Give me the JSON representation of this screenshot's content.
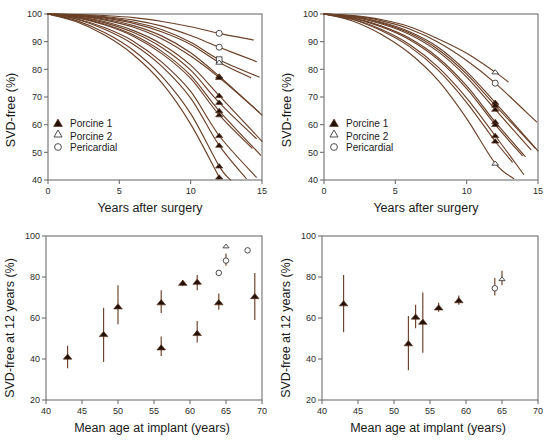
{
  "figure": {
    "panels": [
      "top-left",
      "top-right",
      "bottom-left",
      "bottom-right"
    ],
    "curve_color": "#6b4028",
    "marker_fill_color": "#231008",
    "marker_open_color": "#ffffff",
    "axis_color": "#6f6f6f"
  },
  "legend": {
    "items": [
      {
        "key": "porcine1",
        "label": "Porcine 1",
        "marker": "filled-triangle-icon"
      },
      {
        "key": "porcine2",
        "label": "Porcine 2",
        "marker": "open-triangle-icon"
      },
      {
        "key": "pericardial",
        "label": "Pericardial",
        "marker": "open-circle-icon"
      }
    ]
  },
  "chart_data": [
    {
      "id": "top-left",
      "type": "line",
      "title": "",
      "xlabel": "Years after surgery",
      "ylabel": "SVD-free (%)",
      "xlim": [
        0,
        15
      ],
      "ylim": [
        40,
        100
      ],
      "xticks": [
        0,
        5,
        10,
        15
      ],
      "yticks": [
        40,
        50,
        60,
        70,
        80,
        90,
        100
      ],
      "grid": false,
      "legend_position": "inside-left",
      "series": [
        {
          "name": "curve-1",
          "endpoint_marker": "open-circle",
          "endpoint_x": 12,
          "endpoint_y": 93,
          "x": [
            0,
            2,
            4,
            6,
            8,
            10,
            12,
            14.4
          ],
          "values": [
            100,
            99.8,
            99.4,
            98.7,
            97.3,
            95.4,
            93.0,
            90.6
          ]
        },
        {
          "name": "curve-2",
          "endpoint_marker": "open-circle",
          "endpoint_x": 12,
          "endpoint_y": 88,
          "x": [
            0,
            2,
            4,
            6,
            8,
            10,
            12,
            14.6
          ],
          "values": [
            100,
            99.7,
            99.0,
            97.8,
            95.6,
            92.2,
            88.0,
            82.8
          ]
        },
        {
          "name": "curve-3",
          "endpoint_marker": "open-square",
          "endpoint_x": 12,
          "endpoint_y": 83.5,
          "x": [
            0,
            2,
            4,
            6,
            8,
            10,
            12,
            14.8
          ],
          "values": [
            100,
            99.6,
            98.8,
            97.1,
            94.3,
            89.8,
            83.5,
            77.2
          ]
        },
        {
          "name": "curve-4",
          "endpoint_marker": "open-triangle",
          "endpoint_x": 12,
          "endpoint_y": 82.5,
          "x": [
            0,
            2,
            4,
            6,
            8,
            10,
            12,
            14.2
          ],
          "values": [
            100,
            99.5,
            98.5,
            96.6,
            93.5,
            89.0,
            82.5,
            77.0
          ]
        },
        {
          "name": "curve-5",
          "endpoint_marker": "filled-triangle",
          "endpoint_x": 12,
          "endpoint_y": 77.5,
          "x": [
            0,
            2,
            4,
            6,
            8,
            10,
            12,
            15.0
          ],
          "values": [
            100,
            99.4,
            98.1,
            95.8,
            92.0,
            86.0,
            77.5,
            63.5
          ]
        },
        {
          "name": "curve-6",
          "endpoint_marker": "filled-triangle",
          "endpoint_x": 12,
          "endpoint_y": 77.0,
          "x": [
            0,
            2,
            4,
            6,
            8,
            10,
            12,
            14.8
          ],
          "values": [
            100,
            99.3,
            97.8,
            95.2,
            91.0,
            84.8,
            77.0,
            64.5
          ]
        },
        {
          "name": "curve-7",
          "endpoint_marker": "filled-triangle",
          "endpoint_x": 12,
          "endpoint_y": 70.5,
          "x": [
            0,
            2,
            4,
            6,
            8,
            10,
            12,
            15.0
          ],
          "values": [
            100,
            99.1,
            97.2,
            94.0,
            89.0,
            81.5,
            70.5,
            54.0
          ]
        },
        {
          "name": "curve-8",
          "endpoint_marker": "filled-triangle",
          "endpoint_x": 12,
          "endpoint_y": 68.0,
          "x": [
            0,
            2,
            4,
            6,
            8,
            10,
            12,
            14.6
          ],
          "values": [
            100,
            99.0,
            96.8,
            93.3,
            87.8,
            79.7,
            68.0,
            55.0
          ]
        },
        {
          "name": "curve-9",
          "endpoint_marker": "filled-triangle",
          "endpoint_x": 12,
          "endpoint_y": 65.0,
          "x": [
            0,
            2,
            4,
            6,
            8,
            10,
            12,
            14.9
          ],
          "values": [
            100,
            98.8,
            96.3,
            92.4,
            86.4,
            77.8,
            65.0,
            49.0
          ]
        },
        {
          "name": "curve-10",
          "endpoint_marker": "filled-triangle",
          "endpoint_x": 12,
          "endpoint_y": 63.5,
          "x": [
            0,
            2,
            4,
            6,
            8,
            10,
            12,
            14.3
          ],
          "values": [
            100,
            98.7,
            96.0,
            91.9,
            85.6,
            76.7,
            63.5,
            51.5
          ]
        },
        {
          "name": "curve-11",
          "endpoint_marker": "filled-triangle",
          "endpoint_x": 12,
          "endpoint_y": 56.0,
          "x": [
            0,
            2,
            4,
            6,
            8,
            10,
            12,
            14.6
          ],
          "values": [
            100,
            98.3,
            95.0,
            90.1,
            82.5,
            72.0,
            56.0,
            41.0
          ]
        },
        {
          "name": "curve-12",
          "endpoint_marker": "filled-triangle",
          "endpoint_x": 12,
          "endpoint_y": 52.5,
          "x": [
            0,
            2,
            4,
            6,
            8,
            10,
            12,
            13.9
          ],
          "values": [
            100,
            98.1,
            94.4,
            89.0,
            81.0,
            69.6,
            52.5,
            40.5
          ]
        },
        {
          "name": "curve-13",
          "endpoint_marker": "filled-triangle",
          "endpoint_x": 12,
          "endpoint_y": 45.0,
          "x": [
            0,
            2,
            4,
            6,
            8,
            10,
            12,
            12.8
          ],
          "values": [
            100,
            97.6,
            93.2,
            86.8,
            77.4,
            64.0,
            45.0,
            40.0
          ]
        },
        {
          "name": "curve-14",
          "endpoint_marker": "filled-triangle",
          "endpoint_x": 12,
          "endpoint_y": 41.0,
          "x": [
            0,
            2,
            4,
            6,
            8,
            10,
            12
          ],
          "values": [
            100,
            97.2,
            92.3,
            85.2,
            75.0,
            60.2,
            41.0
          ]
        }
      ]
    },
    {
      "id": "top-right",
      "type": "line",
      "title": "",
      "xlabel": "Years after surgery",
      "ylabel": "SVD-free (%)",
      "xlim": [
        0,
        15
      ],
      "ylim": [
        40,
        100
      ],
      "xticks": [
        0,
        5,
        10,
        15
      ],
      "yticks": [
        40,
        50,
        60,
        70,
        80,
        90,
        100
      ],
      "grid": false,
      "legend_position": "inside-left",
      "series": [
        {
          "name": "curve-1",
          "endpoint_marker": "open-triangle",
          "endpoint_x": 12,
          "endpoint_y": 79.0,
          "x": [
            0,
            2,
            4,
            6,
            8,
            10,
            12,
            12.9
          ],
          "values": [
            100,
            99.4,
            98.0,
            95.4,
            91.0,
            85.8,
            79.0,
            75.5
          ]
        },
        {
          "name": "curve-2",
          "endpoint_marker": "open-circle",
          "endpoint_x": 12,
          "endpoint_y": 75.0,
          "x": [
            0,
            2,
            4,
            6,
            8,
            10,
            12,
            14.9
          ],
          "values": [
            100,
            99.3,
            97.6,
            94.6,
            89.8,
            83.2,
            75.0,
            61.0
          ]
        },
        {
          "name": "curve-3",
          "endpoint_marker": "filled-triangle",
          "endpoint_x": 12,
          "endpoint_y": 68.0,
          "x": [
            0,
            2,
            4,
            6,
            8,
            10,
            12,
            15.0
          ],
          "values": [
            100,
            99.1,
            97.1,
            93.6,
            88.0,
            79.2,
            68.0,
            50.5
          ]
        },
        {
          "name": "curve-4",
          "endpoint_marker": "filled-triangle",
          "endpoint_x": 12,
          "endpoint_y": 67.0,
          "x": [
            0,
            2,
            4,
            6,
            8,
            10,
            12,
            14.8
          ],
          "values": [
            100,
            99.0,
            96.8,
            93.1,
            87.2,
            78.3,
            67.0,
            51.5
          ]
        },
        {
          "name": "curve-5",
          "endpoint_marker": "filled-triangle",
          "endpoint_x": 12,
          "endpoint_y": 65.5,
          "x": [
            0,
            2,
            4,
            6,
            8,
            10,
            12,
            14.5
          ],
          "values": [
            100,
            98.9,
            96.5,
            92.6,
            86.4,
            77.2,
            65.5,
            51.0
          ]
        },
        {
          "name": "curve-6",
          "endpoint_marker": "filled-triangle",
          "endpoint_x": 12,
          "endpoint_y": 61.0,
          "x": [
            0,
            2,
            4,
            6,
            8,
            10,
            12,
            14.1
          ],
          "values": [
            100,
            98.6,
            95.7,
            91.2,
            84.2,
            74.0,
            61.0,
            48.5
          ]
        },
        {
          "name": "curve-7",
          "endpoint_marker": "filled-triangle",
          "endpoint_x": 12,
          "endpoint_y": 60.0,
          "x": [
            0,
            2,
            4,
            6,
            8,
            10,
            12,
            13.9
          ],
          "values": [
            100,
            98.5,
            95.4,
            90.7,
            83.5,
            73.0,
            60.0,
            48.8
          ]
        },
        {
          "name": "curve-8",
          "endpoint_marker": "filled-triangle",
          "endpoint_x": 12,
          "endpoint_y": 56.0,
          "x": [
            0,
            2,
            4,
            6,
            8,
            10,
            12,
            14.0
          ],
          "values": [
            100,
            98.2,
            94.5,
            89.0,
            80.8,
            69.6,
            56.0,
            42.0
          ]
        },
        {
          "name": "curve-9",
          "endpoint_marker": "filled-triangle",
          "endpoint_x": 12,
          "endpoint_y": 54.0,
          "x": [
            0,
            2,
            4,
            6,
            8,
            10,
            12,
            13.2
          ],
          "values": [
            100,
            98.0,
            94.0,
            88.2,
            79.7,
            68.0,
            54.0,
            46.5
          ]
        },
        {
          "name": "curve-10",
          "endpoint_marker": "open-triangle",
          "endpoint_x": 12,
          "endpoint_y": 46.0,
          "x": [
            0,
            2,
            4,
            6,
            8,
            10,
            12,
            13.3
          ],
          "values": [
            100,
            97.5,
            92.7,
            85.8,
            76.0,
            62.2,
            46.0,
            40.5
          ]
        }
      ]
    },
    {
      "id": "bottom-left",
      "type": "scatter",
      "title": "",
      "xlabel": "Mean age at implant (years)",
      "ylabel": "SVD-free at 12 years (%)",
      "xlim": [
        40,
        70
      ],
      "ylim": [
        20,
        100
      ],
      "xticks": [
        40,
        45,
        50,
        55,
        60,
        65,
        70
      ],
      "yticks": [
        20,
        40,
        60,
        80,
        100
      ],
      "grid": false,
      "points": [
        {
          "x": 43.0,
          "y": 41.0,
          "lo": 35.5,
          "hi": 46.5,
          "marker": "filled-triangle"
        },
        {
          "x": 48.0,
          "y": 52.0,
          "lo": 38.5,
          "hi": 65.0,
          "marker": "filled-triangle"
        },
        {
          "x": 50.0,
          "y": 65.5,
          "lo": 57.0,
          "hi": 76.0,
          "marker": "filled-triangle"
        },
        {
          "x": 56.0,
          "y": 45.5,
          "lo": 41.5,
          "hi": 51.0,
          "marker": "filled-triangle"
        },
        {
          "x": 56.0,
          "y": 67.5,
          "lo": 62.5,
          "hi": 73.5,
          "marker": "filled-triangle"
        },
        {
          "x": 59.0,
          "y": 77.0,
          "lo": 75.5,
          "hi": 78.5,
          "marker": "filled-triangle"
        },
        {
          "x": 61.0,
          "y": 52.5,
          "lo": 48.0,
          "hi": 58.5,
          "marker": "filled-triangle"
        },
        {
          "x": 61.0,
          "y": 77.5,
          "lo": 73.5,
          "hi": 81.0,
          "marker": "filled-triangle"
        },
        {
          "x": 64.0,
          "y": 67.5,
          "lo": 64.0,
          "hi": 72.0,
          "marker": "filled-triangle"
        },
        {
          "x": 69.0,
          "y": 70.5,
          "lo": 59.0,
          "hi": 82.0,
          "marker": "filled-triangle"
        },
        {
          "x": 64.0,
          "y": 82.0,
          "lo": 82.0,
          "hi": 82.0,
          "marker": "open-circle"
        },
        {
          "x": 65.0,
          "y": 88.0,
          "lo": 85.5,
          "hi": 91.5,
          "marker": "open-circle"
        },
        {
          "x": 65.0,
          "y": 95.0,
          "lo": 95.0,
          "hi": 95.0,
          "marker": "open-triangle"
        },
        {
          "x": 68.0,
          "y": 93.0,
          "lo": 93.0,
          "hi": 93.0,
          "marker": "open-circle"
        }
      ]
    },
    {
      "id": "bottom-right",
      "type": "scatter",
      "title": "",
      "xlabel": "Mean age at implant (years)",
      "ylabel": "SVD-free at 12 years (%)",
      "xlim": [
        40,
        70
      ],
      "ylim": [
        20,
        100
      ],
      "xticks": [
        40,
        45,
        50,
        55,
        60,
        65,
        70
      ],
      "yticks": [
        20,
        40,
        60,
        80,
        100
      ],
      "grid": false,
      "points": [
        {
          "x": 43.0,
          "y": 67.0,
          "lo": 53.0,
          "hi": 81.0,
          "marker": "filled-triangle"
        },
        {
          "x": 52.0,
          "y": 47.5,
          "lo": 34.5,
          "hi": 61.0,
          "marker": "filled-triangle"
        },
        {
          "x": 53.0,
          "y": 60.5,
          "lo": 55.0,
          "hi": 66.5,
          "marker": "filled-triangle"
        },
        {
          "x": 54.0,
          "y": 58.0,
          "lo": 43.0,
          "hi": 72.5,
          "marker": "filled-triangle"
        },
        {
          "x": 56.2,
          "y": 65.0,
          "lo": 63.0,
          "hi": 67.5,
          "marker": "filled-triangle"
        },
        {
          "x": 59.0,
          "y": 68.5,
          "lo": 66.5,
          "hi": 71.0,
          "marker": "filled-triangle"
        },
        {
          "x": 64.0,
          "y": 74.5,
          "lo": 71.0,
          "hi": 79.5,
          "marker": "open-circle"
        },
        {
          "x": 65.0,
          "y": 79.0,
          "lo": 76.0,
          "hi": 83.0,
          "marker": "open-triangle"
        }
      ]
    }
  ]
}
